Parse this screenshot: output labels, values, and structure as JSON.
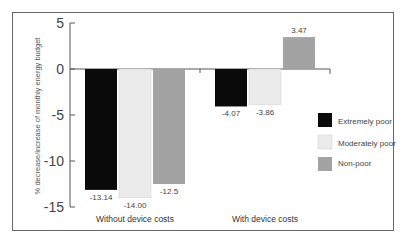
{
  "chart_data": {
    "type": "bar",
    "title": "",
    "xlabel": "",
    "ylabel": "% decrease/increase of monthly energy budget",
    "ylim": [
      -15,
      5
    ],
    "yticks": [
      5,
      0,
      -5,
      -10,
      -15
    ],
    "categories": [
      "Without device costs",
      "With device costs"
    ],
    "series": [
      {
        "name": "Extremely poor",
        "color": "#0a0a0a",
        "values": [
          -13.14,
          -4.07
        ],
        "labels": [
          "-13.14",
          "-4.07"
        ]
      },
      {
        "name": "Moderately poor",
        "color": "#ebebeb",
        "values": [
          -14.0,
          -3.86
        ],
        "labels": [
          "-14.00",
          "-3.86"
        ]
      },
      {
        "name": "Non-poor",
        "color": "#a3a3a3",
        "values": [
          -12.5,
          3.47
        ],
        "labels": [
          "-12.5",
          "3.47"
        ]
      }
    ],
    "legend_position": "right",
    "grid": false
  },
  "axis": {
    "ylabel": "% decrease/increase of monthly energy budget",
    "ticks": [
      "5",
      "0",
      "-5",
      "-10",
      "-15"
    ]
  },
  "categories": [
    "Without device costs",
    "With device costs"
  ],
  "legend": [
    "Extremely poor",
    "Moderately poor",
    "Non-poor"
  ]
}
